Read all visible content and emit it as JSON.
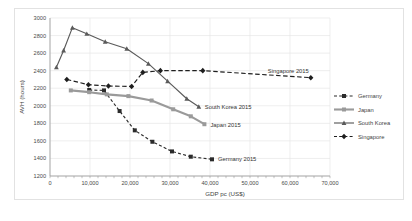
{
  "chart_data": {
    "type": "line",
    "title": "",
    "xlabel": "GDP pc (US$)",
    "ylabel": "AVH (hours)",
    "xlim": [
      0,
      70000
    ],
    "ylim": [
      1200,
      3000
    ],
    "xticks": [
      "0",
      "10,000",
      "20,000",
      "30,000",
      "40,000",
      "50,000",
      "60,000",
      "70,000"
    ],
    "yticks": [
      "1200",
      "1400",
      "1600",
      "1800",
      "2000",
      "2200",
      "2400",
      "2600",
      "2800",
      "3000"
    ],
    "grid": true,
    "legend_position": "right",
    "series": [
      {
        "name": "Germany",
        "color": "#2b2b2b",
        "style": "dashed",
        "marker": "square",
        "points": [
          [
            9800,
            2180
          ],
          [
            13500,
            2175
          ],
          [
            17400,
            1940
          ],
          [
            21200,
            1720
          ],
          [
            25600,
            1590
          ],
          [
            30500,
            1480
          ],
          [
            35200,
            1420
          ],
          [
            40500,
            1390
          ]
        ],
        "end_label": "Germany 2015"
      },
      {
        "name": "Japan",
        "color": "#9a9a9a",
        "style": "solid",
        "marker": "square",
        "points": [
          [
            5200,
            2175
          ],
          [
            9800,
            2155
          ],
          [
            14200,
            2130
          ],
          [
            19600,
            2110
          ],
          [
            25400,
            2060
          ],
          [
            30800,
            1960
          ],
          [
            35200,
            1880
          ],
          [
            38600,
            1790
          ]
        ],
        "end_label": "Japan 2015"
      },
      {
        "name": "South Korea",
        "color": "#5a5a5a",
        "style": "solid",
        "marker": "triangle",
        "points": [
          [
            1600,
            2440
          ],
          [
            3400,
            2630
          ],
          [
            5600,
            2890
          ],
          [
            9200,
            2820
          ],
          [
            13800,
            2730
          ],
          [
            19200,
            2650
          ],
          [
            24600,
            2480
          ],
          [
            29400,
            2280
          ],
          [
            34200,
            2080
          ],
          [
            37200,
            1990
          ]
        ],
        "end_label": "South Korea 2015"
      },
      {
        "name": "Singapore",
        "color": "#1e1e1e",
        "style": "dashed",
        "marker": "diamond",
        "points": [
          [
            4200,
            2300
          ],
          [
            9600,
            2240
          ],
          [
            14600,
            2225
          ],
          [
            20400,
            2220
          ],
          [
            23200,
            2380
          ],
          [
            27600,
            2400
          ],
          [
            38200,
            2400
          ],
          [
            65200,
            2320
          ]
        ],
        "end_label": "Singapore 2015"
      }
    ],
    "annotations": [
      {
        "text": "South Korea 2015",
        "x": 37200,
        "y": 1990
      },
      {
        "text": "Japan 2015",
        "x": 38600,
        "y": 1790
      },
      {
        "text": "Germany 2015",
        "x": 40500,
        "y": 1390
      },
      {
        "text": "Singapore 2015",
        "x": 65200,
        "y": 2320
      }
    ],
    "legend": [
      {
        "label": "Germany",
        "color": "#2b2b2b",
        "style": "dashed",
        "marker": "square"
      },
      {
        "label": "Japan",
        "color": "#9a9a9a",
        "style": "solid",
        "marker": "square"
      },
      {
        "label": "South Korea",
        "color": "#5a5a5a",
        "style": "solid",
        "marker": "triangle"
      },
      {
        "label": "Singapore",
        "color": "#1e1e1e",
        "style": "dashed",
        "marker": "diamond"
      }
    ]
  },
  "caption": ""
}
